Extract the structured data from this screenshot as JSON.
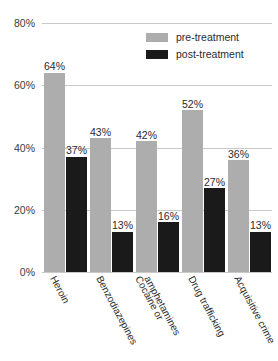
{
  "chart_data": {
    "type": "bar",
    "title": "",
    "subtitle": "",
    "xlabel": "",
    "ylabel": "",
    "ylim": [
      0,
      80
    ],
    "ytick_values": [
      0,
      20,
      40,
      60,
      80
    ],
    "ytick_labels": [
      "0%",
      "20%",
      "40%",
      "60%",
      "80%"
    ],
    "grid": true,
    "legend_position": "top-right",
    "categories": [
      "Heroin",
      "Benzodiazepines",
      "Cocaine or\namphetamines",
      "Drug trafficking",
      "Acquisitive crime"
    ],
    "series": [
      {
        "name": "pre-treatment",
        "color": "#adadad",
        "values": [
          64,
          43,
          42,
          52,
          36
        ],
        "value_labels": [
          "64%",
          "43%",
          "42%",
          "52%",
          "36%"
        ]
      },
      {
        "name": "post-treatment",
        "color": "#1a1a1a",
        "values": [
          37,
          13,
          16,
          27,
          13
        ],
        "value_labels": [
          "37%",
          "13%",
          "16%",
          "27%",
          "13%"
        ]
      }
    ],
    "colors": {
      "pre_treatment": "#adadad",
      "post_treatment": "#1a1a1a",
      "gridline": "#c9c9c9",
      "text": "#2b2b2b",
      "background": "#ffffff"
    }
  },
  "legend": {
    "items": [
      {
        "label": "pre-treatment",
        "swatch": "#adadad"
      },
      {
        "label": "post-treatment",
        "swatch": "#1a1a1a"
      }
    ]
  },
  "axis": {
    "y": {
      "ticks": [
        {
          "label": "80%",
          "value": 80
        },
        {
          "label": "60%",
          "value": 60
        },
        {
          "label": "40%",
          "value": 40
        },
        {
          "label": "20%",
          "value": 20
        },
        {
          "label": "0%",
          "value": 0
        }
      ]
    },
    "x": {
      "ticks": [
        {
          "label": "Heroin"
        },
        {
          "label": "Benzodiazepines"
        },
        {
          "label": "Cocaine or"
        },
        {
          "label": "amphetamines"
        },
        {
          "label": "Drug trafficking"
        },
        {
          "label": "Acquisitive crime"
        }
      ]
    }
  }
}
